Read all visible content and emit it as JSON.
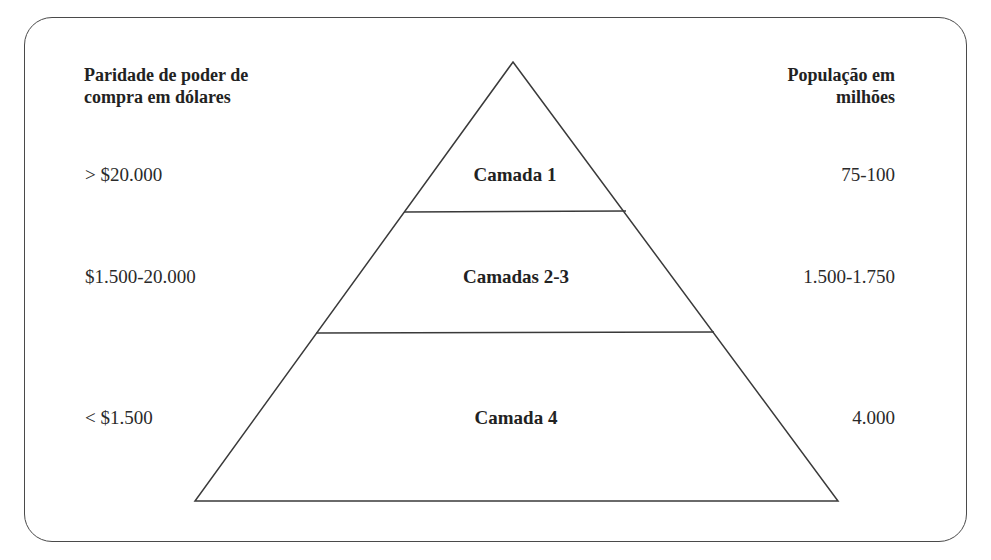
{
  "headers": {
    "left_line1": "Paridade de poder de",
    "left_line2": "compra em dólares",
    "right_line1": "População em",
    "right_line2": "milhões"
  },
  "layers": [
    {
      "name": "Camada 1",
      "ppp": "> $20.000",
      "population": "75-100"
    },
    {
      "name": "Camadas 2-3",
      "ppp": "$1.500-20.000",
      "population": "1.500-1.750"
    },
    {
      "name": "Camada 4",
      "ppp": "< $1.500",
      "population": "4.000"
    }
  ],
  "colors": {
    "stroke": "#3a3a3a",
    "text": "#2a2a2a",
    "background": "#ffffff"
  }
}
